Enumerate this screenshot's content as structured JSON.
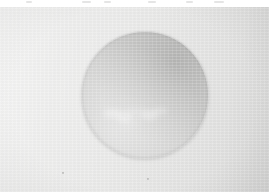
{
  "image": {
    "title": "Grayscale Plate — Illuminated Sphere",
    "kind": "photograph",
    "subject": "large gray sphere on a pale gray field",
    "width": 269,
    "height": 192,
    "tonality": "low-contrast grayscale"
  },
  "plate": {
    "background_color": "#e8e8e7",
    "background_light": "#ececeb",
    "background_dark": "#d7d7d6",
    "top_margin_color": "#ffffff",
    "top_margin_height": 7,
    "texture": "horizontal scan banding with faint vertical emulsion streaks",
    "vignette": "subtle, strongest at corners",
    "lateral_ramp": "left edge lighter, right edge slightly darker"
  },
  "sphere": {
    "label": "sphere",
    "center_x": 145,
    "center_y": 95,
    "radius": 63,
    "diameter": 126,
    "fill_color": "#d4d4d3",
    "core_color": "#dcdcdb",
    "limb_color": "#c2c2c1",
    "limb_shadow_color": "#b0b0ae",
    "shading": "brightest toward lower-left, darker limb toward upper-right",
    "edge": "soft antialiased rim with thin contact shadow"
  },
  "feature": {
    "label": "bright wing-shaped cloud band",
    "position": "lower third of the sphere",
    "color": "#ffffff",
    "opacity": 0.62,
    "blobs": [
      {
        "x": 112,
        "y": 113,
        "w": 18,
        "h": 9,
        "o": 0.55
      },
      {
        "x": 124,
        "y": 116,
        "w": 16,
        "h": 11,
        "o": 0.62
      },
      {
        "x": 136,
        "y": 112,
        "w": 20,
        "h": 8,
        "o": 0.5
      },
      {
        "x": 149,
        "y": 115,
        "w": 17,
        "h": 10,
        "o": 0.58
      },
      {
        "x": 160,
        "y": 111,
        "w": 16,
        "h": 8,
        "o": 0.44
      },
      {
        "x": 130,
        "y": 122,
        "w": 22,
        "h": 7,
        "o": 0.4
      }
    ]
  },
  "artifacts": {
    "margin_specks": [
      {
        "x": 26,
        "w": 6
      },
      {
        "x": 82,
        "w": 9
      },
      {
        "x": 104,
        "w": 7
      },
      {
        "x": 148,
        "w": 8
      },
      {
        "x": 186,
        "w": 7
      },
      {
        "x": 214,
        "w": 10
      }
    ],
    "dust_specks": [
      {
        "x": 147,
        "y": 178
      },
      {
        "x": 62,
        "y": 172
      }
    ]
  }
}
